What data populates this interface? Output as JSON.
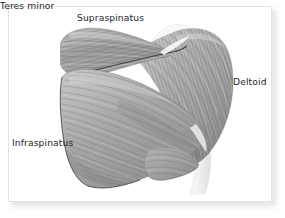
{
  "figure": {
    "name": "posterior-shoulder-muscles-illustration",
    "view": "posterior",
    "background_color": "#ffffff",
    "card_border_color": "#e2e2e3",
    "card_shadow_color": "#e9e9ea",
    "label_color": "#262626"
  },
  "palette": {
    "muscle_light": "#d2d2d2",
    "muscle_mid": "#a9a9a9",
    "muscle_dark": "#8a8a8a",
    "muscle_deep_shadow": "#6f6f6f",
    "fiber_stroke": "#7c7c7c",
    "outline": "#3a3a3a",
    "bone_light": "#f4f4f2",
    "bone_shade": "#e0e0dd",
    "tendon": "#efefed"
  },
  "labels": [
    {
      "id": "supraspinatus",
      "text": "Supraspinatus",
      "x": 77,
      "y": 12
    },
    {
      "id": "deltoid",
      "text": "Deltoid",
      "x": 233,
      "y": 76
    },
    {
      "id": "infraspinatus",
      "text": "Infraspinatus",
      "x": 12,
      "y": 137
    },
    {
      "id": "teres-minor",
      "text": "Teres minor",
      "x": 137,
      "y": 184
    }
  ],
  "structures": [
    {
      "id": "supraspinatus",
      "label": "Supraspinatus",
      "description": "Elongated teardrop muscle belly in the supraspinous fossa above the scapular spine, fibers running lateral toward the greater tubercle."
    },
    {
      "id": "infraspinatus",
      "label": "Infraspinatus",
      "description": "Large triangular muscle filling the infraspinous fossa below the scapular spine, with curved fibers converging laterally."
    },
    {
      "id": "teres-minor",
      "label": "Teres minor",
      "description": "Narrow muscle along the lateral border of the scapula, inferior to the infraspinatus."
    },
    {
      "id": "deltoid",
      "label": "Deltoid",
      "description": "Fan-shaped muscle over the lateral shoulder, posterior fibers sweeping downward to converge on the deltoid tuberosity of the humerus."
    },
    {
      "id": "scapular-spine",
      "label": "",
      "description": "Dark diagonal ridge separating supraspinatus from infraspinatus."
    },
    {
      "id": "humerus-shaft",
      "label": "",
      "description": "Pale bone shaft descending at the lower right beneath the deltoid."
    }
  ]
}
